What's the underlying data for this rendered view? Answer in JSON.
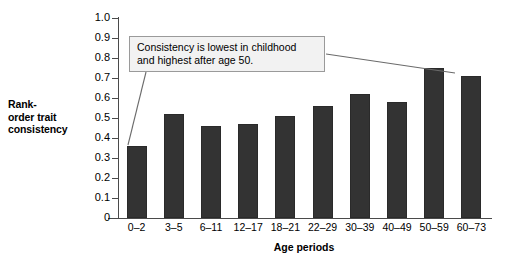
{
  "chart_data": {
    "type": "bar",
    "title": "",
    "xlabel": "Age periods",
    "ylabel": "Rank-order trait consistency",
    "ylim": [
      0,
      1.0
    ],
    "grid": false,
    "legend": null,
    "categories": [
      "0–2",
      "3–5",
      "6–11",
      "12–17",
      "18–21",
      "22–29",
      "30–39",
      "40–49",
      "50–59",
      "60–73"
    ],
    "values": [
      0.36,
      0.52,
      0.46,
      0.47,
      0.51,
      0.56,
      0.62,
      0.58,
      0.75,
      0.71
    ],
    "ytick_labels": [
      "1.0",
      "0.9",
      "0.8",
      "0.7",
      "0.6",
      "0.5",
      "0.4",
      "0.3",
      "0.2",
      "0.1",
      "0"
    ],
    "ytick_values": [
      1.0,
      0.9,
      0.8,
      0.7,
      0.6,
      0.5,
      0.4,
      0.3,
      0.2,
      0.1,
      0
    ],
    "annotations": [
      {
        "text_lines": [
          "Consistency is lowest in childhood",
          "and highest after age 50."
        ],
        "points_to": [
          "0–2",
          "50–59"
        ]
      }
    ],
    "colors": {
      "bar": "#333333",
      "axis": "#4a4a4a",
      "annotation_fill": "#f2f2f2",
      "annotation_border": "#9a9a9a",
      "background": "#ffffff"
    }
  },
  "ylabel_lines": [
    "Rank-",
    "order trait",
    "consistency"
  ]
}
